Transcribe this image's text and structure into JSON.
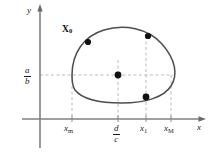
{
  "figure": {
    "type": "phase-plane-diagram",
    "background_color": "#ffffff",
    "curve_color": "#4d4d4d",
    "axis_color": "#808080",
    "dashed_color": "#b3b3b3",
    "dot_color": "#111111",
    "text_color": "#1a1a1a"
  },
  "axes": {
    "x_label": "x",
    "y_label": "y",
    "origin": {
      "x": 40,
      "y": 119
    },
    "x_axis_end": 205,
    "y_axis_top": 6
  },
  "y_ticks": [
    {
      "id": "ab",
      "numerator": "a",
      "denominator": "b",
      "y": 75,
      "dashed": true
    }
  ],
  "x_ticks": [
    {
      "id": "xm",
      "label": "x",
      "sub": "m",
      "x": 72,
      "dashed": true,
      "dash_top": 75
    },
    {
      "id": "dc",
      "numerator": "d",
      "denominator": "c",
      "x": 118,
      "dashed": true,
      "dash_top": 60
    },
    {
      "id": "x1",
      "label": "x",
      "sub": "1",
      "x": 146,
      "dashed": true,
      "dash_top": 36
    },
    {
      "id": "xM",
      "label": "x",
      "sub": "M",
      "x": 171,
      "dashed": true,
      "dash_top": 75
    }
  ],
  "points": [
    {
      "id": "x0",
      "label": "X",
      "sub": "0",
      "x": 88,
      "y": 42,
      "label_x": 62,
      "label_y": 25,
      "radius": 3.1
    },
    {
      "id": "upper-right",
      "label": "",
      "x": 148,
      "y": 36,
      "radius": 3.1
    },
    {
      "id": "equilibrium",
      "label": "",
      "x": 118,
      "y": 75,
      "radius": 3.4
    },
    {
      "id": "lower-right",
      "label": "",
      "x": 146,
      "y": 97,
      "radius": 3.4
    }
  ],
  "orbit": {
    "path": "M 72 75 C 72 53, 84 36, 104 30 C 124 24, 148 28, 162 44 C 176 60, 178 75, 171 86 C 164 97, 146 103, 122 103 C 100 103, 82 99, 75 90 C 72 86, 72 80, 72 75 Z",
    "stroke_width": 1.5
  }
}
